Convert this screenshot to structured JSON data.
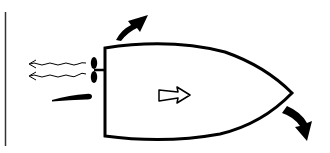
{
  "diagram": {
    "title": "",
    "colors": {
      "stroke": "#000000",
      "background": "#ffffff"
    },
    "elements": [
      {
        "id": "wall-line",
        "type": "line"
      },
      {
        "id": "boat-hull",
        "type": "shape"
      },
      {
        "id": "propeller",
        "type": "shape"
      },
      {
        "id": "wake-lines",
        "type": "wavy-arrows",
        "count": 2
      },
      {
        "id": "rudder",
        "type": "shape"
      },
      {
        "id": "direction-arrow",
        "type": "hollow-arrow",
        "direction": "right"
      },
      {
        "id": "stern-turn-arrow",
        "type": "curved-arrow"
      },
      {
        "id": "bow-turn-arrow",
        "type": "curved-arrow"
      }
    ]
  }
}
